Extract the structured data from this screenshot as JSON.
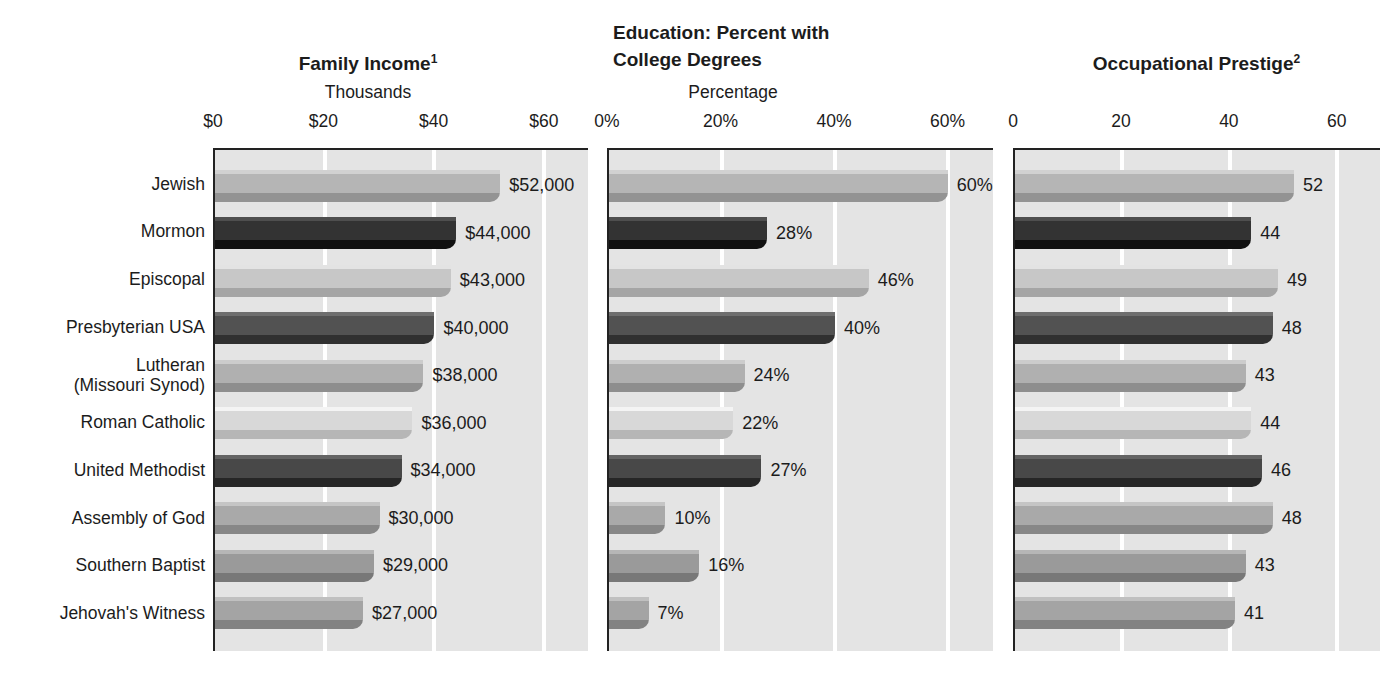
{
  "figure": {
    "colors": {
      "page_background": "#ffffff",
      "plot_background": "#e4e4e4",
      "gridline": "#ffffff",
      "axis_border": "#222222",
      "text": "#1c1c1c"
    }
  },
  "chart_data": {
    "type": "bar",
    "orientation": "horizontal",
    "grid": "white vertical gridlines at each tick",
    "legend": "none",
    "categories": [
      "Jewish",
      "Mormon",
      "Episcopal",
      "Presbyterian USA",
      "Lutheran\n(Missouri Synod)",
      "Roman Catholic",
      "United Methodist",
      "Assembly of God",
      "Southern Baptist",
      "Jehovah's Witness"
    ],
    "category_colors": [
      "#b5b5b5",
      "#333333",
      "#c7c7c7",
      "#525252",
      "#b0b0b0",
      "#d8d8d8",
      "#484848",
      "#a9a9a9",
      "#9a9a9a",
      "#a4a4a4"
    ],
    "charts": [
      {
        "id": "income",
        "title": "Family Income",
        "title_sup": "1",
        "subtitle": "Thousands",
        "tick_labels": [
          "$0",
          "$20",
          "$40",
          "$60"
        ],
        "tick_values": [
          0,
          20,
          40,
          60
        ],
        "axis_max": 68,
        "values": [
          52,
          44,
          43,
          40,
          38,
          36,
          34,
          30,
          29,
          27
        ],
        "value_labels": [
          "$52,000",
          "$44,000",
          "$43,000",
          "$40,000",
          "$38,000",
          "$36,000",
          "$34,000",
          "$30,000",
          "$29,000",
          "$27,000"
        ]
      },
      {
        "id": "education",
        "title_lines": [
          "Education: Percent with",
          "College Degrees"
        ],
        "subtitle": "Percentage",
        "tick_labels": [
          "0%",
          "20%",
          "40%",
          "60%"
        ],
        "tick_values": [
          0,
          20,
          40,
          60
        ],
        "axis_max": 68,
        "values": [
          60,
          28,
          46,
          40,
          24,
          22,
          27,
          10,
          16,
          7
        ],
        "value_labels": [
          "60%",
          "28%",
          "46%",
          "40%",
          "24%",
          "22%",
          "27%",
          "10%",
          "16%",
          "7%"
        ]
      },
      {
        "id": "prestige",
        "title": "Occupational Prestige",
        "title_sup": "2",
        "subtitle": "",
        "tick_labels": [
          "0",
          "20",
          "40",
          "60"
        ],
        "tick_values": [
          0,
          20,
          40,
          60
        ],
        "axis_max": 68,
        "values": [
          52,
          44,
          49,
          48,
          43,
          44,
          46,
          48,
          43,
          41
        ],
        "value_labels": [
          "52",
          "44",
          "49",
          "48",
          "43",
          "44",
          "46",
          "48",
          "43",
          "41"
        ]
      }
    ]
  }
}
